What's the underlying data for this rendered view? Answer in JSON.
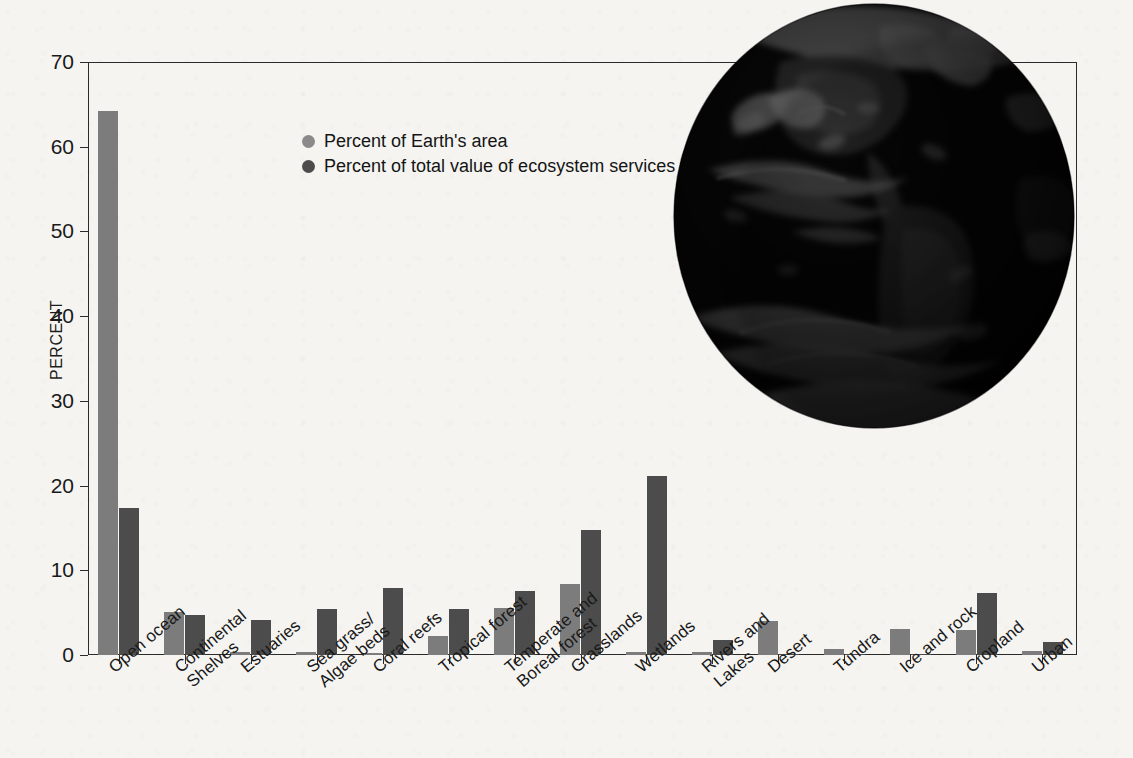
{
  "chart_data": {
    "type": "bar",
    "title": "",
    "subtitle": "",
    "xlabel": "",
    "ylabel": "PERCENT",
    "ylim": [
      0,
      70
    ],
    "yticks": [
      0,
      10,
      20,
      30,
      40,
      50,
      60,
      70
    ],
    "ytick_labels": [
      "0",
      "10",
      "20",
      "30",
      "40",
      "50",
      "60",
      "70"
    ],
    "grid": false,
    "legend_position": "upper-left-inside",
    "categories": [
      "Open ocean",
      "Continental\nShelves",
      "Estuaries",
      "Sea grass/\nAlgae beds",
      "Coral reefs",
      "Tropical forest",
      "Temperate and\nBoreal forest",
      "Grasslands",
      "Wetlands",
      "Rivers and\nLakes",
      "Desert",
      "Tundra",
      "Ice and rock",
      "Cropland",
      "Urban"
    ],
    "series": [
      {
        "name": "Percent of Earth's area",
        "color": "#7c7c7c",
        "values": [
          64.2,
          5.1,
          0.3,
          0.3,
          0.2,
          2.3,
          5.6,
          8.4,
          0.3,
          0.3,
          4.0,
          0.7,
          3.1,
          2.9,
          0.5
        ]
      },
      {
        "name": "Percent of total value of ecosystem services",
        "color": "#4c4c4c",
        "values": [
          17.4,
          4.7,
          4.1,
          5.4,
          7.9,
          5.4,
          7.5,
          14.8,
          21.1,
          1.8,
          0.1,
          0.1,
          0.1,
          7.3,
          1.5
        ]
      }
    ]
  },
  "legend": {
    "items": [
      {
        "label": "Percent of Earth's area",
        "swatch": "light"
      },
      {
        "label": "Percent of total value of ecosystem services",
        "swatch": "dark"
      }
    ]
  },
  "axes": {
    "y_title": "PERCENT"
  },
  "colors": {
    "light_bar": "#7c7c7c",
    "dark_bar": "#4c4c4c",
    "axis": "#2b2b2b",
    "paper": "#f5f4f1"
  },
  "illustration": {
    "name": "earth-globe-photo",
    "description": "Grayscale satellite photograph of Earth showing the Americas"
  }
}
